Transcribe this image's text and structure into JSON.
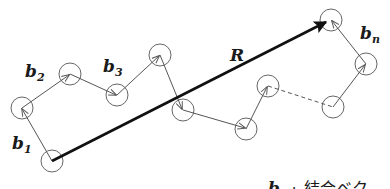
{
  "diagram": {
    "colors": {
      "line": "#555555",
      "r_vector": "#111111",
      "circle": "#666666",
      "text": "#1a1a1a"
    },
    "segments": [
      {
        "id": "c1",
        "x": 52,
        "y": 161
      },
      {
        "id": "c2",
        "x": 22,
        "y": 108
      },
      {
        "id": "c3",
        "x": 70,
        "y": 74
      },
      {
        "id": "c4",
        "x": 117,
        "y": 95
      },
      {
        "id": "c5",
        "x": 160,
        "y": 55
      },
      {
        "id": "c6",
        "x": 183,
        "y": 110
      },
      {
        "id": "c7",
        "x": 246,
        "y": 129
      },
      {
        "id": "c8",
        "x": 268,
        "y": 86
      },
      {
        "id": "c9",
        "x": 333,
        "y": 107
      },
      {
        "id": "c10",
        "x": 366,
        "y": 64
      },
      {
        "id": "c11",
        "x": 331,
        "y": 20
      }
    ],
    "dashed_gap": {
      "from": "c8",
      "to": "c9"
    },
    "labels": {
      "b1": {
        "base": "b",
        "sub": "1"
      },
      "b2": {
        "base": "b",
        "sub": "2"
      },
      "b3": {
        "base": "b",
        "sub": "3"
      },
      "bn": {
        "base": "b",
        "sub": "n"
      },
      "R": "R"
    },
    "caption": {
      "symbol": "b",
      "sub": "i",
      "separator": ":",
      "text": "結合ベク"
    }
  }
}
